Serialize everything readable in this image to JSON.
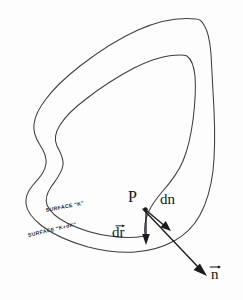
{
  "figure": {
    "background_color": "#fdfdfd",
    "ink_color": "#3c3c42",
    "label_color": "#131316",
    "width": 243,
    "height": 300
  },
  "labels": {
    "point_p": "P",
    "dn": "dn",
    "dr_letters": "dr",
    "n_letters": "n",
    "surface_k": "SURFACE \"K\"",
    "surface_k_plus_dk": "SURFACE \"K+dK\""
  },
  "icons": {
    "vector_arrow_dr": "vector-arrow-icon",
    "vector_arrow_n": "vector-arrow-icon"
  },
  "elements": {
    "outer_curve_name": "surface-k-plus-dk-curve",
    "inner_curve_name": "surface-k-curve",
    "dr_arrow_name": "dr-vector-arrow",
    "dn_arrow_name": "dn-vector-arrow",
    "n_arrow_name": "n-normal-vector-arrow",
    "point_marker_name": "point-p-marker"
  }
}
